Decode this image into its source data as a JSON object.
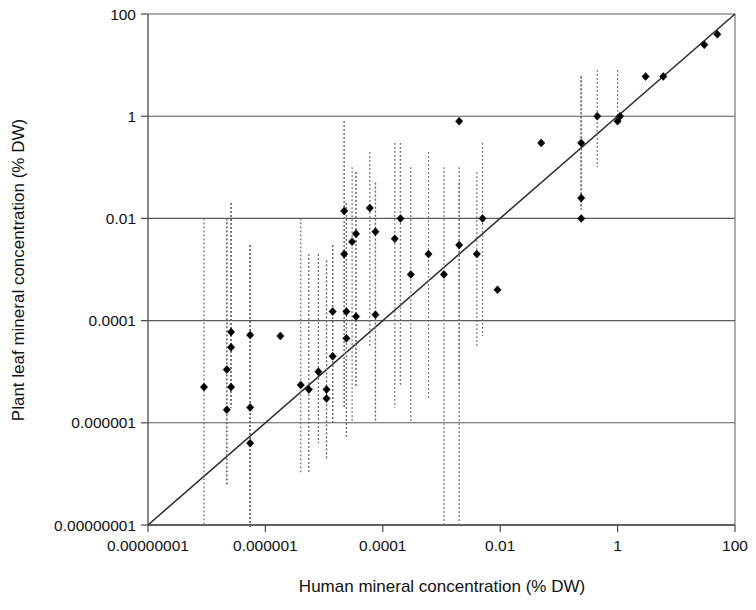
{
  "figure": {
    "background_color": "#fefefe",
    "marker_color": "#000000",
    "errorbar_color": "#6e6e6e",
    "identity_line_color": "#2b2b2b",
    "grid_color": "#5a5a5a"
  },
  "chart_data": {
    "type": "scatter",
    "title": "",
    "xlabel": "Human mineral concentration (% DW)",
    "ylabel": "Plant leaf mineral concentration (% DW)",
    "xscale": "log",
    "yscale": "log",
    "xlim": [
      1e-08,
      100
    ],
    "ylim": [
      1e-08,
      100
    ],
    "grid": true,
    "legend": "none",
    "xticks": [
      1e-08,
      1e-06,
      0.0001,
      0.01,
      1,
      100
    ],
    "xtick_labels": [
      "0.00000001",
      "0.000001",
      "0.0001",
      "0.01",
      "1",
      "100"
    ],
    "yticks": [
      1e-08,
      1e-06,
      0.0001,
      0.01,
      1,
      100
    ],
    "ytick_labels": [
      "0.00000001",
      "0.000001",
      "0.0001",
      "0.01",
      "1",
      "100"
    ],
    "reference_line": {
      "label": "1:1 identity line",
      "from": [
        1e-08,
        1e-08
      ],
      "to": [
        100,
        100
      ]
    },
    "series": [
      {
        "name": "Mineral elements",
        "marker": "filled-diamond",
        "errorbars": "vertical-dotted",
        "points": [
          {
            "x": 9e-08,
            "y": 5e-06,
            "ylow": 1e-08,
            "yhigh": 0.01
          },
          {
            "x": 2.2e-07,
            "y": 1.1e-05,
            "ylow": 6e-08,
            "yhigh": 0.01
          },
          {
            "x": 2.6e-07,
            "y": 6e-05,
            "ylow": 2e-06,
            "yhigh": 0.02
          },
          {
            "x": 2.6e-07,
            "y": 3e-05,
            "ylow": 2e-06,
            "yhigh": 0.02
          },
          {
            "x": 2.6e-07,
            "y": 5e-06,
            "ylow": 2e-06,
            "yhigh": 0.02
          },
          {
            "x": 2.2e-07,
            "y": 1.8e-06,
            "ylow": 6e-08,
            "yhigh": 0.01
          },
          {
            "x": 5.5e-07,
            "y": 5.2e-05,
            "ylow": 1e-10,
            "yhigh": 0.003
          },
          {
            "x": 5.5e-07,
            "y": 2e-06,
            "ylow": 1e-10,
            "yhigh": 0.003
          },
          {
            "x": 5.5e-07,
            "y": 4e-07,
            "ylow": 1e-10,
            "yhigh": 0.003
          },
          {
            "x": 1.8e-06,
            "y": 5e-05,
            "ylow": 5e-05,
            "yhigh": 5e-05
          },
          {
            "x": 4e-06,
            "y": 5.5e-06,
            "ylow": 1e-07,
            "yhigh": 0.01
          },
          {
            "x": 5.5e-06,
            "y": 4.5e-06,
            "ylow": 1e-07,
            "yhigh": 0.002
          },
          {
            "x": 8e-06,
            "y": 1e-05,
            "ylow": 4e-07,
            "yhigh": 0.002
          },
          {
            "x": 1.1e-05,
            "y": 4.5e-06,
            "ylow": 2e-07,
            "yhigh": 0.0015
          },
          {
            "x": 1.1e-05,
            "y": 3e-06,
            "ylow": 2e-07,
            "yhigh": 0.0015
          },
          {
            "x": 1.4e-05,
            "y": 0.00015,
            "ylow": 1e-06,
            "yhigh": 0.003
          },
          {
            "x": 1.4e-05,
            "y": 2e-05,
            "ylow": 1e-06,
            "yhigh": 0.003
          },
          {
            "x": 2.2e-05,
            "y": 0.014,
            "ylow": 2e-06,
            "yhigh": 0.8
          },
          {
            "x": 2.2e-05,
            "y": 0.002,
            "ylow": 2e-06,
            "yhigh": 0.8
          },
          {
            "x": 2.4e-05,
            "y": 0.00015,
            "ylow": 5e-07,
            "yhigh": 0.02
          },
          {
            "x": 2.4e-05,
            "y": 4.5e-05,
            "ylow": 5e-07,
            "yhigh": 0.02
          },
          {
            "x": 3e-05,
            "y": 0.0035,
            "ylow": 1e-06,
            "yhigh": 0.1
          },
          {
            "x": 3.5e-05,
            "y": 0.005,
            "ylow": 5e-06,
            "yhigh": 0.08
          },
          {
            "x": 3.5e-05,
            "y": 0.00012,
            "ylow": 5e-06,
            "yhigh": 0.08
          },
          {
            "x": 6e-05,
            "y": 0.016,
            "ylow": 3e-05,
            "yhigh": 0.2
          },
          {
            "x": 7.5e-05,
            "y": 0.0055,
            "ylow": 1e-06,
            "yhigh": 0.05
          },
          {
            "x": 7.5e-05,
            "y": 0.00013,
            "ylow": 1e-06,
            "yhigh": 0.05
          },
          {
            "x": 0.00016,
            "y": 0.004,
            "ylow": 2e-06,
            "yhigh": 0.3
          },
          {
            "x": 0.0002,
            "y": 0.01,
            "ylow": 5e-06,
            "yhigh": 0.3
          },
          {
            "x": 0.0003,
            "y": 0.0008,
            "ylow": 1e-06,
            "yhigh": 0.1
          },
          {
            "x": 0.0006,
            "y": 0.002,
            "ylow": 3e-06,
            "yhigh": 0.2
          },
          {
            "x": 0.0011,
            "y": 0.0008,
            "ylow": 1e-08,
            "yhigh": 0.1
          },
          {
            "x": 0.002,
            "y": 0.8,
            "ylow": 1e-08,
            "yhigh": 0.1
          },
          {
            "x": 0.002,
            "y": 0.003,
            "ylow": 5e-06,
            "yhigh": 0.05
          },
          {
            "x": 0.004,
            "y": 0.002,
            "ylow": 3e-05,
            "yhigh": 0.08
          },
          {
            "x": 0.005,
            "y": 0.01,
            "ylow": 5e-05,
            "yhigh": 0.3
          },
          {
            "x": 0.009,
            "y": 0.0004,
            "ylow": 0.0004,
            "yhigh": 0.0004
          },
          {
            "x": 0.05,
            "y": 0.3,
            "ylow": 0.3,
            "yhigh": 0.3
          },
          {
            "x": 0.24,
            "y": 0.3,
            "ylow": 0.015,
            "yhigh": 6.0
          },
          {
            "x": 0.24,
            "y": 0.025,
            "ylow": 0.015,
            "yhigh": 6.0
          },
          {
            "x": 0.24,
            "y": 0.01,
            "ylow": 0.015,
            "yhigh": 6.0
          },
          {
            "x": 0.45,
            "y": 1.0,
            "ylow": 0.1,
            "yhigh": 8.0
          },
          {
            "x": 1.0,
            "y": 0.8,
            "ylow": 0.8,
            "yhigh": 8.0
          },
          {
            "x": 1.1,
            "y": 1.0,
            "ylow": 1.0,
            "yhigh": 1.0
          },
          {
            "x": 3.0,
            "y": 6.0,
            "ylow": 6.0,
            "yhigh": 6.0
          },
          {
            "x": 6.0,
            "y": 6.0,
            "ylow": 6.0,
            "yhigh": 6.0
          },
          {
            "x": 30.0,
            "y": 25.0,
            "ylow": 25.0,
            "yhigh": 25.0
          },
          {
            "x": 50.0,
            "y": 40.0,
            "ylow": 40.0,
            "yhigh": 40.0
          }
        ]
      }
    ]
  }
}
